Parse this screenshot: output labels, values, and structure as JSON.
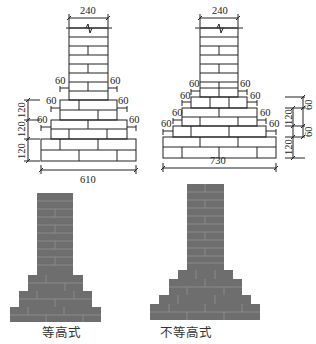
{
  "diagram": {
    "colors": {
      "line": "#222222",
      "brick_fill": "#6e6e6e",
      "brick_joint": "#8a8a8a",
      "background": "#ffffff"
    },
    "left_drawing": {
      "type": "equal-height",
      "wall_width_label": "240",
      "step_offset_labels": [
        "60",
        "60",
        "60",
        "60",
        "60",
        "60"
      ],
      "height_labels": [
        "120",
        "120",
        "120"
      ],
      "base_width_label": "610"
    },
    "right_drawing": {
      "type": "unequal-height",
      "wall_width_label": "240",
      "step_offset_labels": [
        "60",
        "60",
        "60",
        "60",
        "60",
        "60",
        "60",
        "60"
      ],
      "height_labels_left_col": [
        "120",
        "120"
      ],
      "height_labels_right_col": [
        "60",
        "60"
      ],
      "base_width_label": "730"
    },
    "captions": {
      "left": "等高式",
      "right": "不等高式"
    }
  }
}
